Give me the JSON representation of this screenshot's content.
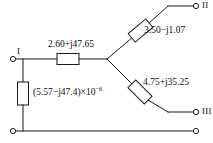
{
  "diagram": {
    "type": "electrical-circuit-schematic",
    "colors": {
      "wire": "#1a1a1a",
      "background": "#ffffff",
      "text": "#111111"
    },
    "terminals": [
      {
        "id": "I",
        "label": "I",
        "position": "left-upper"
      },
      {
        "id": "II",
        "label": "II",
        "position": "right-top"
      },
      {
        "id": "III",
        "label": "III",
        "position": "right-lower"
      }
    ],
    "components": [
      {
        "id": "series-impedance",
        "label": "2.60+j47.65",
        "orientation": "horizontal",
        "branch": "terminal-I-to-junction"
      },
      {
        "id": "shunt-admittance",
        "label_prefix": "(5.57−j47.4)×10",
        "label_exponent": "−6",
        "label_full": "(5.57−j47.4)×10−6",
        "orientation": "vertical",
        "branch": "junction-to-ground-rail"
      },
      {
        "id": "upper-branch-impedance",
        "label": "3.50−j1.07",
        "orientation": "diagonal-up",
        "branch": "junction-to-terminal-II"
      },
      {
        "id": "lower-branch-impedance",
        "label": "4.75+j35.25",
        "orientation": "diagonal-down",
        "branch": "junction-to-terminal-III"
      }
    ],
    "ground_rail": {
      "id": "bottom-rail",
      "left_terminal": true,
      "right_terminal": true
    }
  }
}
